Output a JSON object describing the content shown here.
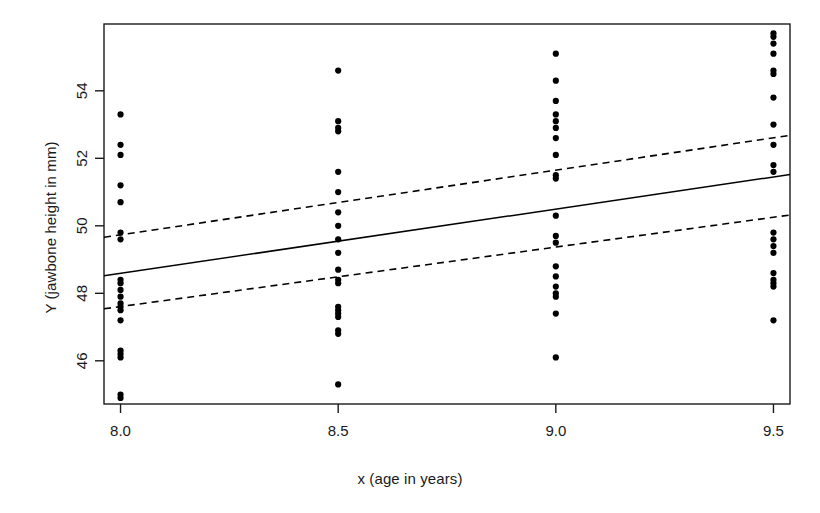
{
  "chart_data": {
    "type": "scatter",
    "title": "",
    "xlabel": "x (age in years)",
    "ylabel": "Y (jawbone height in mm)",
    "xlim": [
      7.962,
      9.538
    ],
    "ylim": [
      44.72,
      55.98
    ],
    "grid": false,
    "legend": "none",
    "xticks": [
      8.0,
      8.5,
      9.0,
      9.5
    ],
    "xticklabels": [
      "8.0",
      "8.5",
      "9.0",
      "9.5"
    ],
    "yticks": [
      46,
      48,
      50,
      52,
      54
    ],
    "yticklabels": [
      "46",
      "48",
      "50",
      "52",
      "54"
    ],
    "point_color": "#000000",
    "point_radius": 3.1,
    "line_color": "#000000",
    "series": [
      {
        "name": "observations",
        "type": "scatter",
        "x": [
          8.0,
          8.0,
          8.0,
          8.0,
          8.0,
          8.0,
          8.0,
          8.0,
          8.0,
          8.0,
          8.0,
          8.0,
          8.0,
          8.0,
          8.0,
          8.0,
          8.0,
          8.0,
          8.0,
          8.0,
          8.5,
          8.5,
          8.5,
          8.5,
          8.5,
          8.5,
          8.5,
          8.5,
          8.5,
          8.5,
          8.5,
          8.5,
          8.5,
          8.5,
          8.5,
          8.5,
          8.5,
          8.5,
          8.5,
          8.5,
          9.0,
          9.0,
          9.0,
          9.0,
          9.0,
          9.0,
          9.0,
          9.0,
          9.0,
          9.0,
          9.0,
          9.0,
          9.0,
          9.0,
          9.0,
          9.0,
          9.0,
          9.0,
          9.0,
          9.0,
          9.5,
          9.5,
          9.5,
          9.5,
          9.5,
          9.5,
          9.5,
          9.5,
          9.5,
          9.5,
          9.5,
          9.5,
          9.5,
          9.5,
          9.5,
          9.5,
          9.5,
          9.5,
          9.5,
          9.5
        ],
        "y": [
          53.3,
          52.4,
          52.1,
          51.2,
          50.7,
          49.8,
          49.6,
          48.4,
          48.1,
          47.9,
          47.7,
          47.5,
          47.2,
          46.3,
          46.2,
          46.1,
          45.0,
          44.9,
          48.3,
          47.6,
          54.6,
          53.1,
          52.9,
          52.8,
          51.6,
          51.0,
          50.4,
          50.0,
          49.6,
          48.7,
          48.4,
          48.3,
          47.6,
          47.5,
          47.4,
          47.3,
          46.9,
          46.8,
          49.2,
          45.3,
          55.1,
          54.3,
          53.7,
          53.3,
          53.1,
          52.9,
          52.6,
          52.1,
          51.5,
          51.4,
          50.3,
          49.7,
          49.5,
          48.8,
          48.5,
          48.2,
          48.0,
          47.9,
          47.4,
          46.1,
          55.7,
          55.6,
          55.4,
          55.1,
          54.6,
          54.5,
          53.8,
          53.0,
          52.4,
          51.8,
          51.6,
          49.8,
          49.6,
          49.4,
          49.2,
          48.6,
          48.4,
          48.3,
          48.2,
          47.2
        ]
      },
      {
        "name": "fitted regression line",
        "type": "line",
        "style": "solid",
        "x": [
          7.962,
          9.538
        ],
        "y": [
          48.52,
          51.52
        ]
      },
      {
        "name": "upper confidence band",
        "type": "line",
        "style": "dashed",
        "x": [
          7.962,
          9.538
        ],
        "y": [
          49.66,
          52.68
        ]
      },
      {
        "name": "lower confidence band",
        "type": "line",
        "style": "dashed",
        "x": [
          7.962,
          9.538
        ],
        "y": [
          47.54,
          50.32
        ]
      }
    ]
  },
  "axes": {
    "frame_color": "#1a1a1a"
  }
}
